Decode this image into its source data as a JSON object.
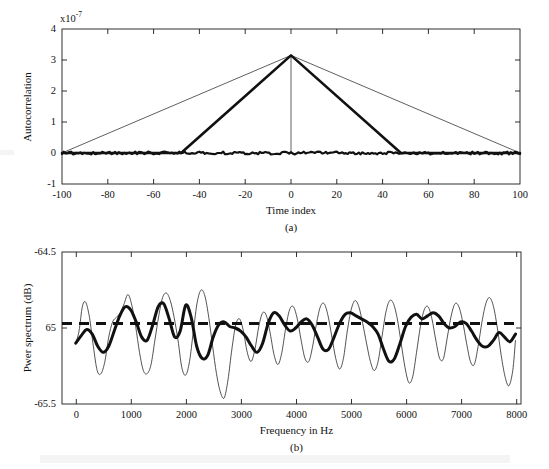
{
  "figure": {
    "background_color": "#ffffff",
    "ink_color": "#111111"
  },
  "chart_data": [
    {
      "id": "panel-a",
      "type": "line",
      "title": "",
      "panel_label": "(a)",
      "xlabel": "Time index",
      "ylabel": "Autocorrelation",
      "y_multiplier_label": "x10",
      "y_multiplier_exponent": "-7",
      "y_multiplier_value": 1e-07,
      "xlim": [
        -100,
        100
      ],
      "ylim": [
        -1,
        4
      ],
      "xticks": [
        -100,
        -80,
        -60,
        -40,
        -20,
        0,
        20,
        40,
        60,
        80,
        100
      ],
      "xticklabels": [
        "-100",
        "-80",
        "-60",
        "-40",
        "-20",
        "0",
        "20",
        "40",
        "60",
        "80",
        "100"
      ],
      "yticks": [
        -1,
        0,
        1,
        2,
        3,
        4
      ],
      "yticklabels": [
        "-1",
        "0",
        "1",
        "2",
        "3",
        "4"
      ],
      "grid": false,
      "legend": "none",
      "series": [
        {
          "name": "wide-triangle-thin",
          "style": "thin-solid",
          "linewidth": 0.6,
          "description": "Triangular autocorrelation spanning the full lag range, apex at lag 0",
          "x": [
            -100,
            0,
            100
          ],
          "values": [
            0.0,
            3.15,
            0.0
          ]
        },
        {
          "name": "narrow-triangle-thick",
          "style": "thick-solid",
          "linewidth": 2.6,
          "description": "Triangular autocorrelation truncated at +/-48 lags, apex at lag 0",
          "x": [
            -100,
            -48,
            0,
            48,
            100
          ],
          "values": [
            0.0,
            0.0,
            3.15,
            0.0,
            0.0
          ]
        },
        {
          "name": "zero-baseline-noise",
          "style": "thick-noisy",
          "linewidth": 2.2,
          "description": "Noisy near-zero baseline trace across all lags",
          "x": [
            -100,
            100
          ],
          "values": [
            0.0,
            0.0
          ],
          "noise_amplitude": 0.045
        },
        {
          "name": "center-vertical-marker",
          "style": "thin-solid",
          "linewidth": 0.6,
          "description": "Vertical line at lag 0 from baseline to apex",
          "x": [
            0,
            0
          ],
          "values": [
            0.0,
            3.15
          ]
        }
      ]
    },
    {
      "id": "panel-b",
      "type": "line",
      "title": "",
      "panel_label": "(b)",
      "xlabel": "Frequency in Hz",
      "ylabel": "Pwer spectrum (dB)",
      "xlim": [
        -250,
        8100
      ],
      "ylim": [
        -65.5,
        -64.5
      ],
      "xticks": [
        0,
        1000,
        2000,
        3000,
        4000,
        5000,
        6000,
        7000,
        8000
      ],
      "xticklabels": [
        "0",
        "1000",
        "2000",
        "3000",
        "4000",
        "5000",
        "6000",
        "7000",
        "8000"
      ],
      "yticks": [
        -65.5,
        -65.0,
        -64.5
      ],
      "yticklabels": [
        "-65.5",
        "65",
        "-64.5"
      ],
      "grid": false,
      "legend": "none",
      "series": [
        {
          "name": "true-spectrum-level",
          "style": "thick-dashed",
          "linewidth": 2.8,
          "description": "Flat dashed reference line at the true spectrum level",
          "level": -64.97
        },
        {
          "name": "periodogram-fine",
          "style": "thin-solid",
          "linewidth": 0.7,
          "description": "Rapidly fluctuating spectral estimate (narrow lag window)",
          "x": [
            0,
            60,
            120,
            180,
            250,
            320,
            390,
            460,
            530,
            600,
            670,
            740,
            810,
            880,
            950,
            1020,
            1090,
            1160,
            1230,
            1300,
            1370,
            1440,
            1510,
            1580,
            1650,
            1720,
            1790,
            1860,
            1930,
            2000,
            2070,
            2140,
            2210,
            2280,
            2350,
            2420,
            2490,
            2560,
            2630,
            2700,
            2770,
            2840,
            2910,
            2980,
            3050,
            3120,
            3190,
            3260,
            3330,
            3400,
            3470,
            3540,
            3610,
            3680,
            3750,
            3820,
            3890,
            3960,
            4030,
            4100,
            4170,
            4240,
            4310,
            4380,
            4450,
            4520,
            4590,
            4660,
            4730,
            4800,
            4870,
            4940,
            5010,
            5080,
            5150,
            5220,
            5290,
            5360,
            5430,
            5500,
            5570,
            5640,
            5710,
            5780,
            5850,
            5920,
            5990,
            6060,
            6130,
            6200,
            6270,
            6340,
            6410,
            6480,
            6550,
            6620,
            6690,
            6760,
            6830,
            6900,
            6970,
            7040,
            7110,
            7180,
            7250,
            7320,
            7390,
            7460,
            7530,
            7600,
            7670,
            7740,
            7810,
            7880,
            7950,
            8000
          ],
          "values": [
            -65.1,
            -65.02,
            -64.86,
            -64.83,
            -64.93,
            -65.12,
            -65.28,
            -65.3,
            -65.22,
            -65.06,
            -64.96,
            -64.93,
            -64.9,
            -64.84,
            -64.78,
            -64.85,
            -64.99,
            -65.16,
            -65.28,
            -65.3,
            -65.24,
            -65.08,
            -64.92,
            -64.8,
            -64.77,
            -64.82,
            -64.93,
            -65.08,
            -65.26,
            -65.31,
            -65.22,
            -65.02,
            -64.83,
            -64.75,
            -64.79,
            -64.93,
            -65.12,
            -65.3,
            -65.42,
            -65.46,
            -65.34,
            -65.14,
            -64.98,
            -64.94,
            -65.02,
            -65.16,
            -65.22,
            -65.14,
            -64.99,
            -64.9,
            -64.92,
            -65.04,
            -65.18,
            -65.24,
            -65.16,
            -65.0,
            -64.88,
            -64.86,
            -64.94,
            -65.08,
            -65.2,
            -65.22,
            -65.12,
            -64.97,
            -64.86,
            -64.84,
            -64.92,
            -65.06,
            -65.2,
            -65.27,
            -65.2,
            -65.02,
            -64.88,
            -64.82,
            -64.86,
            -64.97,
            -65.1,
            -65.22,
            -65.28,
            -65.22,
            -65.06,
            -64.9,
            -64.82,
            -64.84,
            -64.94,
            -65.1,
            -65.26,
            -65.36,
            -65.32,
            -65.16,
            -64.99,
            -64.88,
            -64.86,
            -64.94,
            -65.08,
            -65.2,
            -65.2,
            -65.06,
            -64.92,
            -64.84,
            -64.86,
            -64.96,
            -65.1,
            -65.22,
            -65.24,
            -65.12,
            -64.96,
            -64.84,
            -64.8,
            -64.86,
            -65.0,
            -65.18,
            -65.32,
            -65.38,
            -65.28,
            -65.08,
            -64.96
          ]
        },
        {
          "name": "smoothed-spectrum",
          "style": "thick-solid",
          "linewidth": 2.8,
          "description": "Smoothed spectral estimate (wide lag window)",
          "x": [
            0,
            100,
            200,
            300,
            400,
            500,
            600,
            700,
            800,
            900,
            1000,
            1100,
            1200,
            1300,
            1400,
            1500,
            1600,
            1700,
            1800,
            1900,
            2000,
            2100,
            2200,
            2300,
            2400,
            2500,
            2600,
            2700,
            2800,
            2900,
            3000,
            3100,
            3200,
            3300,
            3400,
            3500,
            3600,
            3700,
            3800,
            3900,
            4000,
            4100,
            4200,
            4300,
            4400,
            4500,
            4600,
            4700,
            4800,
            4900,
            5000,
            5100,
            5200,
            5300,
            5400,
            5500,
            5600,
            5700,
            5800,
            5900,
            6000,
            6100,
            6200,
            6300,
            6400,
            6500,
            6600,
            6700,
            6800,
            6900,
            7000,
            7100,
            7200,
            7300,
            7400,
            7500,
            7600,
            7700,
            7800,
            7900,
            8000
          ],
          "values": [
            -65.1,
            -65.05,
            -65.01,
            -65.04,
            -65.12,
            -65.16,
            -65.12,
            -65.02,
            -64.92,
            -64.86,
            -64.88,
            -64.96,
            -65.06,
            -65.08,
            -64.98,
            -64.86,
            -64.84,
            -64.94,
            -65.06,
            -65.02,
            -64.85,
            -64.93,
            -65.12,
            -65.2,
            -65.18,
            -65.06,
            -64.98,
            -64.96,
            -64.99,
            -65.0,
            -65.02,
            -65.06,
            -65.12,
            -65.16,
            -65.1,
            -64.97,
            -64.9,
            -64.92,
            -64.98,
            -65.02,
            -65.0,
            -64.96,
            -64.94,
            -64.98,
            -65.06,
            -65.14,
            -65.14,
            -65.06,
            -64.97,
            -64.91,
            -64.9,
            -64.92,
            -64.94,
            -64.96,
            -64.99,
            -65.04,
            -65.14,
            -65.22,
            -65.2,
            -65.1,
            -64.99,
            -64.93,
            -64.91,
            -64.94,
            -64.92,
            -64.9,
            -64.92,
            -64.97,
            -65.0,
            -64.99,
            -64.96,
            -64.97,
            -65.02,
            -65.08,
            -65.12,
            -65.12,
            -65.08,
            -65.03,
            -65.06,
            -65.09,
            -65.04
          ]
        }
      ]
    }
  ]
}
